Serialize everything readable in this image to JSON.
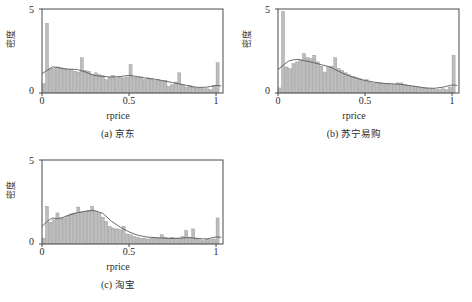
{
  "figure": {
    "panels": [
      {
        "id": "a",
        "caption_index": "(a)",
        "caption_text": "京东",
        "xlabel": "rprice",
        "ylabel": "密度",
        "xticks": [
          "0",
          "0.5",
          "1"
        ],
        "yticks": [
          "0",
          "5"
        ]
      },
      {
        "id": "b",
        "caption_index": "(b)",
        "caption_text": "苏宁易购",
        "xlabel": "rprice",
        "ylabel": "密度",
        "xticks": [
          "0",
          "0.5",
          "1"
        ],
        "yticks": [
          "0",
          "5"
        ]
      },
      {
        "id": "c",
        "caption_index": "(c)",
        "caption_text": "淘宝",
        "xlabel": "rprice",
        "ylabel": "密度",
        "xticks": [
          "0",
          "0.5",
          "1"
        ],
        "yticks": [
          "0",
          "5"
        ]
      }
    ]
  },
  "colors": {
    "bar_fill": "#bdbdbd",
    "bar_stroke": "#8a8a8a",
    "kde_line": "#5a5a5a",
    "frame": "#4a4a4a",
    "background": "#ffffff"
  },
  "chart_data": [
    {
      "type": "bar",
      "id": "a",
      "title": "(a) 京东",
      "xlabel": "rprice",
      "ylabel": "密度",
      "xlim": [
        0,
        1.04
      ],
      "ylim": [
        0,
        5
      ],
      "xticks": [
        0,
        0.5,
        1
      ],
      "yticks": [
        0,
        5
      ],
      "grid": false,
      "legend": null,
      "bin_width": 0.02,
      "bin_starts": [
        0.0,
        0.02,
        0.04,
        0.06,
        0.08,
        0.1,
        0.12,
        0.14,
        0.16,
        0.18,
        0.2,
        0.22,
        0.24,
        0.26,
        0.28,
        0.3,
        0.32,
        0.34,
        0.36,
        0.38,
        0.4,
        0.42,
        0.44,
        0.46,
        0.48,
        0.5,
        0.52,
        0.54,
        0.56,
        0.58,
        0.6,
        0.62,
        0.64,
        0.66,
        0.68,
        0.7,
        0.72,
        0.74,
        0.76,
        0.78,
        0.8,
        0.82,
        0.84,
        0.86,
        0.88,
        0.9,
        0.92,
        0.94,
        0.96,
        0.98,
        1.0
      ],
      "values": [
        0.55,
        4.15,
        1.45,
        1.45,
        1.55,
        1.5,
        1.45,
        1.4,
        1.4,
        1.3,
        1.25,
        2.1,
        1.35,
        1.3,
        1.1,
        1.2,
        1.1,
        1.05,
        0.8,
        0.95,
        1.05,
        0.9,
        0.95,
        0.9,
        0.95,
        1.7,
        0.95,
        0.95,
        0.95,
        0.8,
        0.9,
        0.85,
        0.75,
        0.8,
        0.7,
        0.75,
        0.4,
        0.5,
        0.65,
        1.2,
        0.5,
        0.35,
        0.45,
        0.35,
        0.3,
        0.3,
        0.25,
        0.25,
        0.2,
        0.45,
        1.8
      ],
      "kde_x": [
        0.0,
        0.03,
        0.06,
        0.09,
        0.12,
        0.15,
        0.2,
        0.25,
        0.3,
        0.35,
        0.4,
        0.45,
        0.5,
        0.55,
        0.6,
        0.65,
        0.7,
        0.75,
        0.8,
        0.85,
        0.9,
        0.95,
        1.0,
        1.03
      ],
      "kde_y": [
        1.15,
        1.35,
        1.55,
        1.52,
        1.45,
        1.42,
        1.4,
        1.25,
        1.05,
        0.98,
        0.95,
        0.98,
        1.05,
        0.98,
        0.88,
        0.82,
        0.72,
        0.62,
        0.52,
        0.4,
        0.33,
        0.35,
        0.45,
        0.42
      ]
    },
    {
      "type": "bar",
      "id": "b",
      "title": "(b) 苏宁易购",
      "xlabel": "rprice",
      "ylabel": "密度",
      "xlim": [
        0,
        1.04
      ],
      "ylim": [
        0,
        5
      ],
      "xticks": [
        0,
        0.5,
        1
      ],
      "yticks": [
        0,
        5
      ],
      "grid": false,
      "legend": null,
      "bin_width": 0.02,
      "bin_starts": [
        0.0,
        0.02,
        0.04,
        0.06,
        0.08,
        0.1,
        0.12,
        0.14,
        0.16,
        0.18,
        0.2,
        0.22,
        0.24,
        0.26,
        0.28,
        0.3,
        0.32,
        0.34,
        0.36,
        0.38,
        0.4,
        0.42,
        0.44,
        0.46,
        0.48,
        0.5,
        0.52,
        0.54,
        0.56,
        0.58,
        0.6,
        0.62,
        0.64,
        0.66,
        0.68,
        0.7,
        0.72,
        0.74,
        0.76,
        0.78,
        0.8,
        0.82,
        0.84,
        0.86,
        0.88,
        0.9,
        0.92,
        0.94,
        0.96,
        0.98,
        1.0
      ],
      "values": [
        0.3,
        4.85,
        1.55,
        1.45,
        1.75,
        1.85,
        1.95,
        2.35,
        2.1,
        2.05,
        2.25,
        1.85,
        1.6,
        1.25,
        1.55,
        1.6,
        2.1,
        1.45,
        1.35,
        1.2,
        1.1,
        1.0,
        0.95,
        0.85,
        0.75,
        0.8,
        0.65,
        0.6,
        0.6,
        0.6,
        0.55,
        0.55,
        0.5,
        0.5,
        0.6,
        0.6,
        0.5,
        0.45,
        0.4,
        0.4,
        0.35,
        0.3,
        0.3,
        0.25,
        0.25,
        0.2,
        0.2,
        0.25,
        0.2,
        0.35,
        2.25
      ],
      "kde_x": [
        0.0,
        0.03,
        0.06,
        0.09,
        0.12,
        0.15,
        0.2,
        0.25,
        0.3,
        0.35,
        0.4,
        0.45,
        0.5,
        0.55,
        0.6,
        0.65,
        0.7,
        0.75,
        0.8,
        0.85,
        0.9,
        0.95,
        1.0,
        1.03
      ],
      "kde_y": [
        1.4,
        1.65,
        1.9,
        1.98,
        2.0,
        1.92,
        1.82,
        1.68,
        1.55,
        1.28,
        1.05,
        0.88,
        0.75,
        0.65,
        0.58,
        0.55,
        0.52,
        0.45,
        0.38,
        0.3,
        0.28,
        0.35,
        0.48,
        0.45
      ]
    },
    {
      "type": "bar",
      "id": "c",
      "title": "(c) 淘宝",
      "xlabel": "rprice",
      "ylabel": "密度",
      "xlim": [
        0,
        1.04
      ],
      "ylim": [
        0,
        5
      ],
      "xticks": [
        0,
        0.5,
        1
      ],
      "yticks": [
        0,
        5
      ],
      "grid": false,
      "legend": null,
      "bin_width": 0.02,
      "bin_starts": [
        0.0,
        0.02,
        0.04,
        0.06,
        0.08,
        0.1,
        0.12,
        0.14,
        0.16,
        0.18,
        0.2,
        0.22,
        0.24,
        0.26,
        0.28,
        0.3,
        0.32,
        0.34,
        0.36,
        0.38,
        0.4,
        0.42,
        0.44,
        0.46,
        0.48,
        0.5,
        0.52,
        0.54,
        0.56,
        0.58,
        0.6,
        0.62,
        0.64,
        0.66,
        0.68,
        0.7,
        0.72,
        0.74,
        0.76,
        0.78,
        0.8,
        0.82,
        0.84,
        0.86,
        0.88,
        0.9,
        0.92,
        0.94,
        0.96,
        0.98,
        1.0
      ],
      "values": [
        0.35,
        2.25,
        1.3,
        1.45,
        1.85,
        1.55,
        1.55,
        1.7,
        1.8,
        1.85,
        2.2,
        1.9,
        1.95,
        2.0,
        2.25,
        1.95,
        1.85,
        1.6,
        1.35,
        1.05,
        0.95,
        0.9,
        0.85,
        1.05,
        0.6,
        0.55,
        0.45,
        0.4,
        0.35,
        0.35,
        0.3,
        0.35,
        0.4,
        0.35,
        0.55,
        0.4,
        0.35,
        0.4,
        0.35,
        0.35,
        0.45,
        0.8,
        0.4,
        0.9,
        0.35,
        0.25,
        0.2,
        0.3,
        0.25,
        0.3,
        1.55
      ],
      "kde_x": [
        0.0,
        0.03,
        0.06,
        0.09,
        0.12,
        0.15,
        0.2,
        0.25,
        0.3,
        0.35,
        0.4,
        0.45,
        0.5,
        0.55,
        0.6,
        0.65,
        0.7,
        0.75,
        0.8,
        0.85,
        0.9,
        0.95,
        1.0,
        1.03
      ],
      "kde_y": [
        1.05,
        1.35,
        1.55,
        1.5,
        1.58,
        1.7,
        1.85,
        1.95,
        2.0,
        1.82,
        1.35,
        1.0,
        0.72,
        0.52,
        0.42,
        0.38,
        0.35,
        0.33,
        0.35,
        0.38,
        0.32,
        0.3,
        0.42,
        0.4
      ]
    }
  ]
}
